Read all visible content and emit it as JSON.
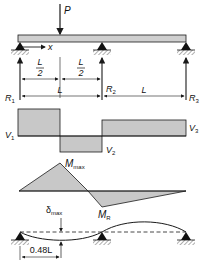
{
  "colors": {
    "line": "#1a1a1a",
    "fill": "#c8c8c8",
    "beam_fill": "#cfcfcf",
    "background": "#ffffff"
  },
  "loading": {
    "load_label": "P",
    "axis_label": "x",
    "half_span_numerator": "L",
    "half_span_denominator": "2",
    "span_label_1": "L",
    "span_label_2": "L"
  },
  "reactions": {
    "r1": {
      "main": "R",
      "sub": "1"
    },
    "r2": {
      "main": "R",
      "sub": "2"
    },
    "r3": {
      "main": "R",
      "sub": "3"
    }
  },
  "shear_diagram": {
    "v1": {
      "main": "V",
      "sub": "1"
    },
    "v2": {
      "main": "V",
      "sub": "2"
    },
    "v3": {
      "main": "V",
      "sub": "3"
    }
  },
  "moment_diagram": {
    "mmax": {
      "main": "M",
      "sub": "max"
    },
    "mr": {
      "main": "M",
      "sub": "R"
    }
  },
  "deflection_diagram": {
    "dmax": {
      "main": "δ",
      "sub": "max"
    },
    "location_label": "0.48L"
  }
}
